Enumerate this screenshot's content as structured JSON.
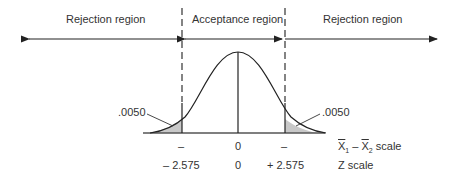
{
  "regions": {
    "left_rejection": "Rejection region",
    "acceptance": "Acceptance region",
    "right_rejection": "Rejection region"
  },
  "tail_areas": {
    "left": ".0050",
    "right": ".0050"
  },
  "xbar_scale": {
    "left_tick": "–",
    "center": "0",
    "right_tick": "–",
    "label_prefix": "X",
    "label_sub1": "1",
    "label_minus": " – ",
    "label_sub2": "2",
    "label_suffix": " scale"
  },
  "z_scale": {
    "left": "– 2.575",
    "center": "0",
    "right": "+ 2.575",
    "label": "Z scale"
  },
  "colors": {
    "line": "#222222",
    "shade": "#c8c8c8",
    "text": "#333333"
  }
}
